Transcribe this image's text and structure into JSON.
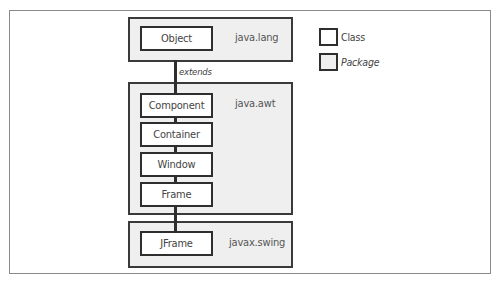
{
  "diagram": {
    "packages": [
      {
        "name": "java.lang",
        "classes": [
          "Object"
        ]
      },
      {
        "name": "java.awt",
        "classes": [
          "Component",
          "Container",
          "Window",
          "Frame"
        ]
      },
      {
        "name": "javax.swing",
        "classes": [
          "JFrame"
        ]
      }
    ],
    "relation_label": "extends",
    "legend": {
      "class_label": "Class",
      "package_label": "Package"
    },
    "colors": {
      "package_fill": "#efefef",
      "class_fill": "#ffffff",
      "border": "#2e2e2e"
    }
  }
}
